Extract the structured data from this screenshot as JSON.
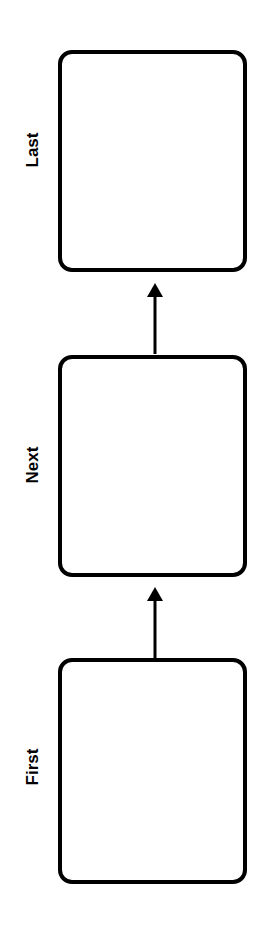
{
  "diagram": {
    "type": "vertical-flow",
    "direction": "bottom-to-top",
    "stroke_color": "#000000",
    "background_color": "#ffffff",
    "nodes": [
      {
        "id": "last",
        "label": "Last"
      },
      {
        "id": "next",
        "label": "Next"
      },
      {
        "id": "first",
        "label": "First"
      }
    ],
    "edges": [
      {
        "from": "first",
        "to": "next"
      },
      {
        "from": "next",
        "to": "last"
      }
    ]
  }
}
